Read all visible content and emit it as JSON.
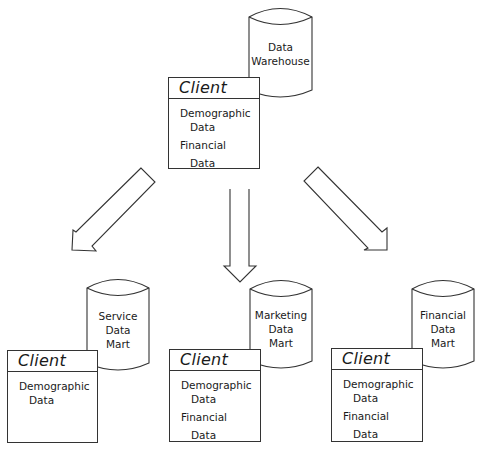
{
  "warehouse": {
    "label_lines": [
      "Data",
      "Warehouse"
    ],
    "client": {
      "title": "Client",
      "fields": [
        {
          "line1": "Demographic",
          "line2": "Data"
        },
        {
          "line1": "Financial",
          "line2": "Data"
        }
      ]
    }
  },
  "marts": [
    {
      "label_lines": [
        "Service",
        "Data",
        "Mart"
      ],
      "client": {
        "title": "Client",
        "fields": [
          {
            "line1": "Demographic",
            "line2": "Data"
          }
        ]
      }
    },
    {
      "label_lines": [
        "Marketing",
        "Data",
        "Mart"
      ],
      "client": {
        "title": "Client",
        "fields": [
          {
            "line1": "Demographic",
            "line2": "Data"
          },
          {
            "line1": "Financial",
            "line2": "Data"
          }
        ]
      }
    },
    {
      "label_lines": [
        "Financial",
        "Data",
        "Mart"
      ],
      "client": {
        "title": "Client",
        "fields": [
          {
            "line1": "Demographic",
            "line2": "Data"
          },
          {
            "line1": "Financial",
            "line2": "Data"
          }
        ]
      }
    }
  ],
  "arrows": [
    {
      "name": "warehouse-to-service-mart",
      "direction": "down-left"
    },
    {
      "name": "warehouse-to-marketing-mart",
      "direction": "down"
    },
    {
      "name": "warehouse-to-financial-mart",
      "direction": "down-right"
    }
  ],
  "colors": {
    "stroke": "#333333",
    "background": "#ffffff"
  }
}
